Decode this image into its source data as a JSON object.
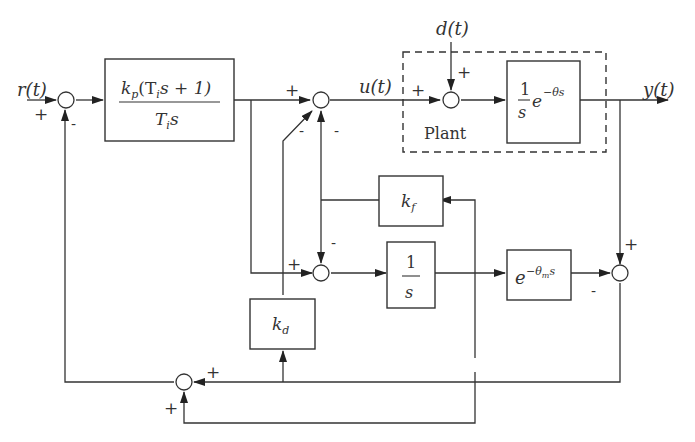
{
  "diagram": {
    "signals": {
      "reference": "r(t)",
      "control": "u(t)",
      "disturbance": "d(t)",
      "output": "y(t)"
    },
    "blocks": {
      "pi_controller": {
        "numerator": "k_p(T_i s + 1)",
        "num_main": "k",
        "num_sub": "p",
        "num_rest": "(T",
        "num_sub2": "i",
        "num_tail": "s + 1)",
        "den_main": "T",
        "den_sub": "i",
        "den_tail": "s"
      },
      "plant_model": {
        "num": "1",
        "den": "s",
        "exp_base": "e",
        "exp": "−θs"
      },
      "kf_gain": {
        "main": "k",
        "sub": "f"
      },
      "integrator": {
        "num": "1",
        "den": "s"
      },
      "delay_model": {
        "base": "e",
        "exp_main": "−θ",
        "exp_sub": "m",
        "exp_tail": "s"
      },
      "kd_gain": {
        "main": "k",
        "sub": "d"
      }
    },
    "plant_label": "Plant",
    "signs": {
      "plus": "+",
      "minus": "-"
    }
  }
}
